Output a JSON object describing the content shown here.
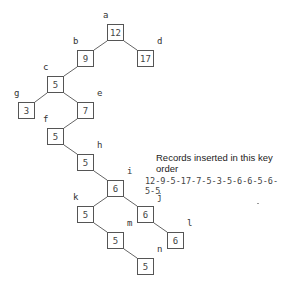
{
  "diagram": {
    "type": "binary-search-tree",
    "nodes": [
      {
        "id": "a",
        "key": "12",
        "x": 107,
        "y": 24
      },
      {
        "id": "b",
        "key": "9",
        "x": 77,
        "y": 50
      },
      {
        "id": "d",
        "key": "17",
        "x": 137,
        "y": 50
      },
      {
        "id": "c",
        "key": "5",
        "x": 47,
        "y": 76
      },
      {
        "id": "g",
        "key": "3",
        "x": 18,
        "y": 102
      },
      {
        "id": "e",
        "key": "7",
        "x": 77,
        "y": 102
      },
      {
        "id": "f",
        "key": "5",
        "x": 47,
        "y": 128
      },
      {
        "id": "h",
        "key": "5",
        "x": 77,
        "y": 154
      },
      {
        "id": "i",
        "key": "6",
        "x": 107,
        "y": 180
      },
      {
        "id": "k",
        "key": "5",
        "x": 77,
        "y": 206
      },
      {
        "id": "j",
        "key": "6",
        "x": 137,
        "y": 206
      },
      {
        "id": "m",
        "key": "5",
        "x": 107,
        "y": 232
      },
      {
        "id": "l",
        "key": "6",
        "x": 167,
        "y": 232
      },
      {
        "id": "n",
        "key": "5",
        "x": 137,
        "y": 258
      }
    ],
    "edges": [
      [
        "a",
        "b"
      ],
      [
        "a",
        "d"
      ],
      [
        "b",
        "c"
      ],
      [
        "c",
        "g"
      ],
      [
        "c",
        "e"
      ],
      [
        "e",
        "f"
      ],
      [
        "f",
        "h"
      ],
      [
        "h",
        "i"
      ],
      [
        "i",
        "k"
      ],
      [
        "i",
        "j"
      ],
      [
        "k",
        "m"
      ],
      [
        "j",
        "l"
      ],
      [
        "m",
        "n"
      ]
    ],
    "caption": "Records inserted in this key order",
    "insertion_order": "12-9-5-17-7-5-3-5-6-6-5-6-5-5"
  }
}
